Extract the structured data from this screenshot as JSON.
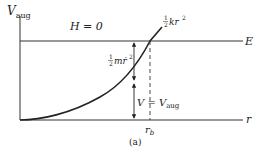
{
  "figure": {
    "caption": "(a)",
    "y_axis_label": "V",
    "y_axis_label_sub": "aug",
    "x_axis_label": "r",
    "energy_line_label": "E",
    "hamiltonian_label": "H = 0",
    "curve_label_frac_num": "1",
    "curve_label_frac_den": "2",
    "curve_label_rest": "kr",
    "curve_label_exp": "2",
    "kinetic_label_frac_num": "1",
    "kinetic_label_frac_den": "2",
    "kinetic_label_rest": "m",
    "kinetic_label_dot": "ṙ",
    "kinetic_label_exp": "2",
    "potential_label_lhs": "V = V",
    "potential_label_sub": "aug",
    "turning_point_label": "r",
    "turning_point_sub": "b",
    "colors": {
      "ink": "#222222",
      "background": "#ffffff"
    }
  }
}
